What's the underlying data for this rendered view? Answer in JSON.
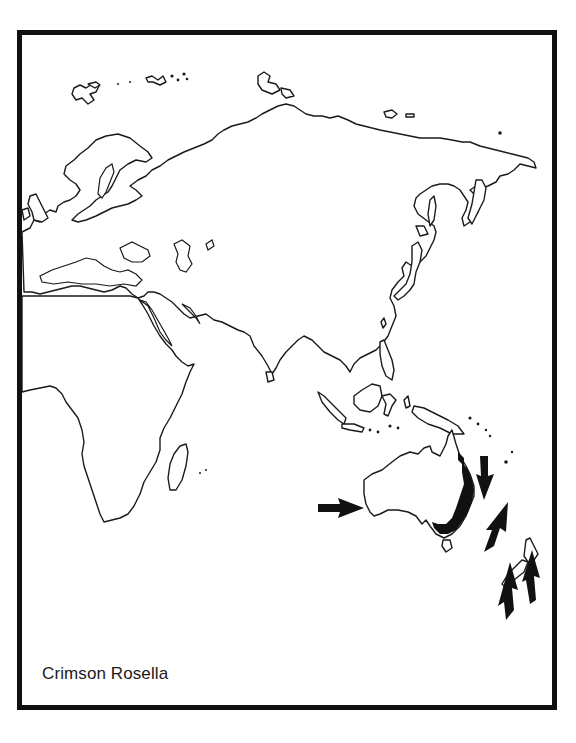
{
  "map": {
    "title": "Crimson Rosella",
    "region": "Eurasia, Africa and Australasia outline map",
    "range_color": "#111111",
    "outline_color": "#1a1a1a",
    "background_color": "#ffffff",
    "range_areas": [
      {
        "name": "eastern-australia-coast",
        "description": "Shaded range along eastern and south-eastern Australia"
      }
    ],
    "arrows": [
      {
        "name": "arrow-western-australia",
        "direction": "east",
        "points_to": "south-west Australia"
      },
      {
        "name": "arrow-coral-sea",
        "direction": "south",
        "points_to": "eastern Australia coast"
      },
      {
        "name": "arrow-tasman-sea",
        "direction": "north-east",
        "points_to": "Norfolk Island area"
      },
      {
        "name": "arrow-nz-south",
        "direction": "north",
        "points_to": "New Zealand South Island"
      },
      {
        "name": "arrow-nz-north",
        "direction": "north",
        "points_to": "New Zealand North Island"
      }
    ]
  }
}
